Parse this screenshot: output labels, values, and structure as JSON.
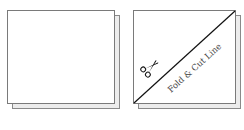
{
  "diagrams": [
    {
      "name": "plain-square-sheet",
      "description": "Unfolded square paper"
    },
    {
      "name": "folded-square-sheet",
      "fold_label": "Fold & Cut Line",
      "icon": "scissors-icon"
    }
  ]
}
